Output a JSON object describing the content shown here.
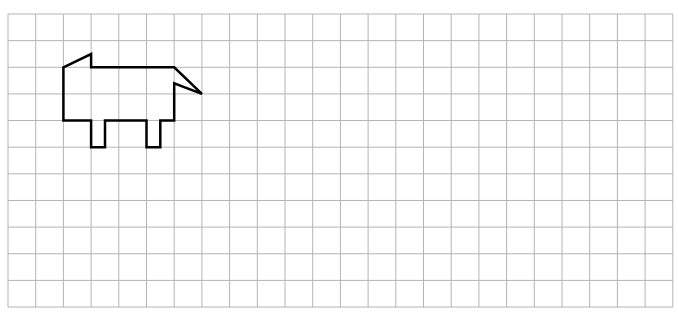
{
  "grid": {
    "columns": 24,
    "rows": 11,
    "left": 8,
    "top": 14,
    "cell_width": 27.7,
    "cell_height": 26.64,
    "line_color": "#b4b4b4",
    "line_width": 1
  },
  "figure": {
    "name": "animal-outline",
    "stroke_color": "#000000",
    "stroke_width": 2.5,
    "points_grid_units": [
      [
        2,
        2
      ],
      [
        3,
        1.5
      ],
      [
        3,
        2
      ],
      [
        6,
        2
      ],
      [
        7,
        3
      ],
      [
        6,
        2.6
      ],
      [
        6,
        4
      ],
      [
        5.5,
        4
      ],
      [
        5.5,
        5
      ],
      [
        5,
        5
      ],
      [
        5,
        4
      ],
      [
        3.5,
        4
      ],
      [
        3.5,
        5
      ],
      [
        3,
        5
      ],
      [
        3,
        4
      ],
      [
        2,
        4
      ]
    ]
  }
}
